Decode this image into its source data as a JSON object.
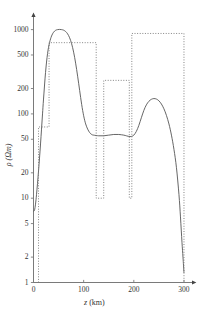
{
  "chart_data": {
    "type": "line",
    "title": "",
    "subtitle": "",
    "xlabel": "z (km)",
    "xlabel_symbol": "z",
    "xlabel_unit": "(km)",
    "ylabel": "ρ (Ωm)",
    "ylabel_symbol": "ρ",
    "ylabel_unit": "(Ωm)",
    "xscale": "linear",
    "yscale": "log",
    "xlim": [
      0,
      310
    ],
    "ylim": [
      1,
      1300
    ],
    "xticks": [
      0,
      100,
      200,
      300
    ],
    "xtick_labels": [
      "0",
      "100",
      "200",
      "300"
    ],
    "yticks": [
      1,
      2,
      5,
      10,
      20,
      50,
      100,
      200,
      500,
      1000
    ],
    "ytick_labels": [
      "1",
      "2",
      "5",
      "10",
      "20",
      "50",
      "100",
      "200",
      "500",
      "1000"
    ],
    "grid": false,
    "legend": null,
    "legend_position": "none",
    "series": [
      {
        "name": "smooth inverted model",
        "style": "solid",
        "color": "#555555",
        "x": [
          0,
          2,
          4,
          6,
          8,
          10,
          12,
          14,
          16,
          18,
          20,
          24,
          28,
          32,
          36,
          40,
          44,
          48,
          52,
          56,
          60,
          64,
          68,
          72,
          76,
          80,
          84,
          88,
          92,
          96,
          100,
          104,
          108,
          112,
          116,
          120,
          130,
          140,
          150,
          160,
          170,
          180,
          185,
          190,
          195,
          200,
          205,
          210,
          215,
          220,
          225,
          230,
          235,
          240,
          245,
          250,
          255,
          260,
          265,
          270,
          275,
          280,
          285,
          290,
          293,
          296,
          298,
          300
        ],
        "y": [
          7,
          7.2,
          8.5,
          11,
          15,
          21,
          30,
          44,
          66,
          100,
          150,
          310,
          520,
          700,
          840,
          930,
          980,
          1000,
          1005,
          1000,
          985,
          950,
          890,
          800,
          680,
          540,
          400,
          280,
          190,
          130,
          95,
          76,
          66,
          60,
          57,
          56,
          55,
          55,
          56,
          57,
          57,
          56,
          55,
          54,
          54,
          56,
          62,
          73,
          90,
          110,
          128,
          141,
          149,
          152,
          150,
          143,
          131,
          115,
          96,
          76,
          56,
          38,
          23,
          11,
          6,
          3,
          2,
          1.3
        ]
      },
      {
        "name": "true blocky model",
        "style": "dotted",
        "color": "#777777",
        "x": [
          10,
          10,
          31,
          31,
          125,
          125,
          140,
          140,
          191,
          191,
          196,
          196,
          300,
          300
        ],
        "y": [
          1,
          70,
          70,
          700,
          700,
          10,
          10,
          250,
          250,
          10,
          10,
          900,
          900,
          1
        ]
      }
    ],
    "layers": [
      {
        "z_start": 10,
        "z_end": 31,
        "rho": 70
      },
      {
        "z_start": 31,
        "z_end": 125,
        "rho": 700
      },
      {
        "z_start": 140,
        "z_end": 191,
        "rho": 250
      },
      {
        "z_start": 196,
        "z_end": 300,
        "rho": 900
      }
    ]
  },
  "axes": {
    "x_axis_name": "depth-axis",
    "y_axis_name": "resistivity-axis"
  }
}
